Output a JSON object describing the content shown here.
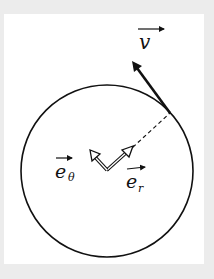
{
  "diagram": {
    "type": "circular-motion-polar-unit-vectors",
    "labels": {
      "velocity": "v",
      "unit_theta": "e",
      "unit_theta_sub": "θ",
      "unit_r": "e",
      "unit_r_sub": "r"
    },
    "colors": {
      "stroke": "#111111",
      "background": "#ffffff",
      "border": "#ececec"
    }
  }
}
